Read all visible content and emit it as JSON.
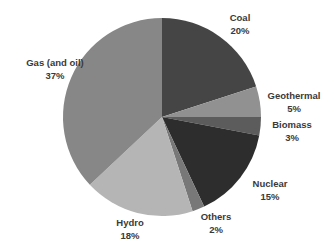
{
  "chart_data": {
    "type": "pie",
    "title": "",
    "legend": "none",
    "labels_position": "outside",
    "direction": "clockwise",
    "start_angle_deg": 0,
    "background": "#ffffff",
    "label_color": "#3a3a3a",
    "slices": [
      {
        "id": "coal",
        "label": "Coal",
        "value": 20,
        "pct_label": "20%",
        "color": "#454545"
      },
      {
        "id": "geothermal",
        "label": "Geothermal",
        "value": 5,
        "pct_label": "5%",
        "color": "#919191"
      },
      {
        "id": "biomass",
        "label": "Biomass",
        "value": 3,
        "pct_label": "3%",
        "color": "#5c5c5c"
      },
      {
        "id": "nuclear",
        "label": "Nuclear",
        "value": 15,
        "pct_label": "15%",
        "color": "#2d2d2d"
      },
      {
        "id": "others",
        "label": "Others",
        "value": 2,
        "pct_label": "2%",
        "color": "#787878"
      },
      {
        "id": "hydro",
        "label": "Hydro",
        "value": 18,
        "pct_label": "18%",
        "color": "#b5b5b5"
      },
      {
        "id": "gas",
        "label": "Gas (and oil)",
        "value": 37,
        "pct_label": "37%",
        "color": "#878787"
      }
    ]
  }
}
